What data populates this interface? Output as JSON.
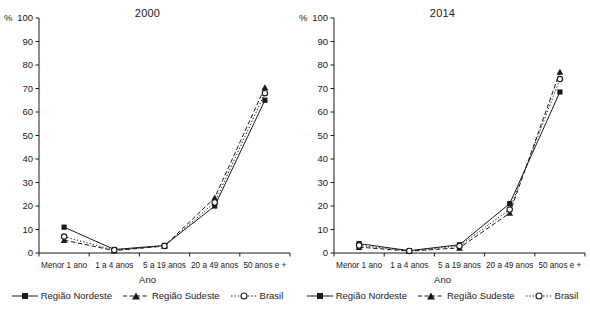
{
  "axis": {
    "y_unit": "%",
    "y_ticks": [
      0,
      10,
      20,
      30,
      40,
      50,
      60,
      70,
      80,
      90,
      100
    ],
    "x_title": "Ano"
  },
  "legend": {
    "entries": [
      {
        "label": "Região Nordeste",
        "marker": "filled-square-marker",
        "line": "solid"
      },
      {
        "label": "Região Sudeste",
        "marker": "filled-triangle-marker",
        "line": "dashed"
      },
      {
        "label": "Brasil",
        "marker": "open-circle-marker",
        "line": "dotted"
      }
    ]
  },
  "chart_data": [
    {
      "type": "line",
      "title": "2000",
      "xlabel": "Ano",
      "ylabel": "%",
      "ylim": [
        0,
        100
      ],
      "yticks": [
        0,
        10,
        20,
        30,
        40,
        50,
        60,
        70,
        80,
        90,
        100
      ],
      "grid": false,
      "legend_position": "bottom",
      "categories": [
        "Menor 1 ano",
        "1 a 4 anos",
        "5 a 19 anos",
        "20 a 49 anos",
        "50 anos e +"
      ],
      "series": [
        {
          "name": "Região Nordeste",
          "values": [
            11.0,
            1.5,
            3.2,
            20.0,
            65.0
          ]
        },
        {
          "name": "Região Sudeste",
          "values": [
            5.5,
            1.0,
            3.0,
            23.5,
            70.5
          ]
        },
        {
          "name": "Brasil",
          "values": [
            7.0,
            1.2,
            3.0,
            21.5,
            68.0
          ]
        }
      ]
    },
    {
      "type": "line",
      "title": "2014",
      "xlabel": "Ano",
      "ylabel": "%",
      "ylim": [
        0,
        100
      ],
      "yticks": [
        0,
        10,
        20,
        30,
        40,
        50,
        60,
        70,
        80,
        90,
        100
      ],
      "grid": false,
      "legend_position": "bottom",
      "categories": [
        "Menor 1 ano",
        "1 a 4 anos",
        "5 a 19 anos",
        "20 a 49 anos",
        "50 anos e +"
      ],
      "series": [
        {
          "name": "Região Nordeste",
          "values": [
            4.0,
            1.0,
            3.5,
            21.0,
            68.5
          ]
        },
        {
          "name": "Região Sudeste",
          "values": [
            2.5,
            0.8,
            2.2,
            17.0,
            77.0
          ]
        },
        {
          "name": "Brasil",
          "values": [
            3.2,
            0.9,
            3.0,
            18.5,
            74.0
          ]
        }
      ]
    }
  ]
}
